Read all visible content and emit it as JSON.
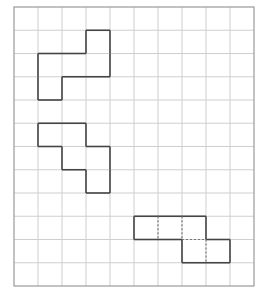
{
  "grid": {
    "origin_x": 14,
    "origin_y": 7,
    "cols": 10,
    "rows": 12,
    "cell_w": 24,
    "cell_h": 23.25,
    "line_color": "#cfcfcf",
    "border_color": "#999999"
  },
  "shapes": [
    {
      "name": "shape-1",
      "cells": [
        [
          3,
          1
        ],
        [
          1,
          2
        ],
        [
          2,
          2
        ],
        [
          3,
          2
        ],
        [
          1,
          3
        ]
      ],
      "stroke": "#444444",
      "dashed_segments": []
    },
    {
      "name": "shape-2",
      "cells": [
        [
          1,
          5
        ],
        [
          2,
          5
        ],
        [
          2,
          6
        ],
        [
          3,
          6
        ],
        [
          3,
          7
        ]
      ],
      "stroke": "#444444",
      "dashed_segments": []
    },
    {
      "name": "shape-3",
      "cells": [
        [
          5,
          9
        ],
        [
          6,
          9
        ],
        [
          7,
          9
        ],
        [
          7,
          10
        ],
        [
          8,
          10
        ]
      ],
      "stroke": "#444444",
      "dashed_segments": [
        [
          [
            6,
            9
          ],
          [
            6,
            10
          ]
        ],
        [
          [
            7,
            9
          ],
          [
            7,
            10
          ]
        ],
        [
          [
            7,
            10
          ],
          [
            8,
            10
          ]
        ],
        [
          [
            8,
            10
          ],
          [
            8,
            11
          ]
        ]
      ]
    }
  ]
}
